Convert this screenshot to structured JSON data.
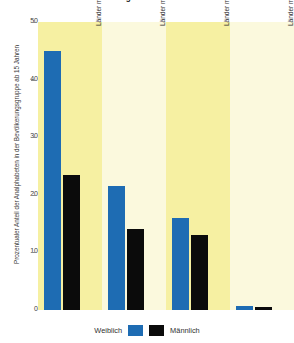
{
  "chart_data": {
    "type": "bar",
    "title": "Landern die dauer im Landervergleich",
    "xlabel": "",
    "ylabel": "Prozentualer Anteil der Analphabeten in der Bevölkerungsgruppe ab 15 Jahren",
    "ylim": [
      0,
      50
    ],
    "yticks": [
      0,
      10,
      20,
      30,
      40,
      50
    ],
    "ytick_labels": [
      "0",
      "10",
      "20",
      "30",
      "40",
      "50"
    ],
    "grid": false,
    "legend_position": "bottom",
    "categories": [
      "Länder mit hohem Einkommen",
      "Länder mit mittleren Einkommen, obere Kategorie",
      "Länder mit mittlerem Einkommen, untere Kategorie",
      "Länder mit niedrigem Einkommen"
    ],
    "series": [
      {
        "name": "Weiblich",
        "color": "#1e6cb3",
        "values": [
          45.0,
          21.5,
          16.0,
          0.7
        ]
      },
      {
        "name": "Männlich",
        "color": "#0b0b0b",
        "values": [
          23.5,
          14.0,
          13.0,
          0.5
        ]
      }
    ]
  },
  "legend": {
    "female_label": "Weiblich",
    "male_label": "Männlich"
  },
  "colors": {
    "female": "#1e6cb3",
    "male": "#0b0b0b",
    "band_shaded": "#f6f0a2",
    "band_plain": "#fbf9dd",
    "background": "#ffffff"
  }
}
